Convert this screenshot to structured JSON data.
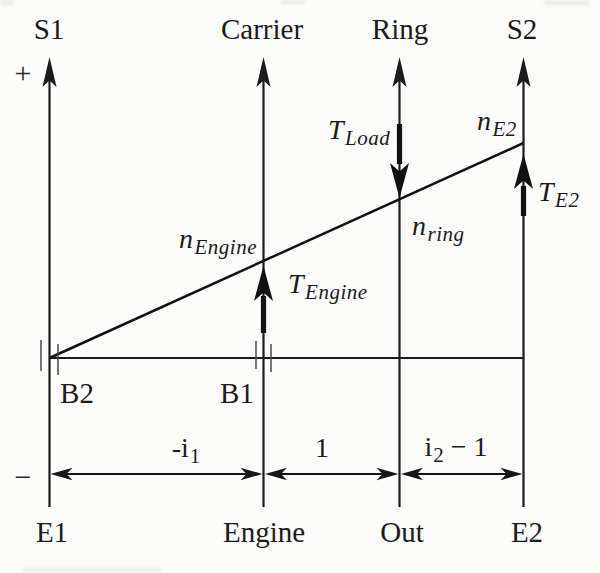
{
  "colors": {
    "ink": "#1b1b1b",
    "paper": "#fcfcfa",
    "tick": "#4a4a4a"
  },
  "signs": {
    "positive": "+",
    "negative": "−"
  },
  "axes": [
    {
      "id": "s1",
      "top_label": "S1",
      "bottom_label": "E1"
    },
    {
      "id": "carrier",
      "top_label": "Carrier",
      "bottom_label": "Engine"
    },
    {
      "id": "ring",
      "top_label": "Ring",
      "bottom_label": "Out"
    },
    {
      "id": "s2",
      "top_label": "S2",
      "bottom_label": "E2"
    }
  ],
  "support_points": {
    "b2": "B2",
    "b1": "B1"
  },
  "dimension_labels": {
    "i1": {
      "pre": "-i",
      "sub": "1",
      "post": ""
    },
    "unity": "1",
    "i2": {
      "pre": "i",
      "sub": "2",
      "post": " − 1"
    }
  },
  "speed_labels": {
    "n_engine": {
      "main": "n",
      "sub": "Engine"
    },
    "n_ring": {
      "main": "n",
      "sub": "ring"
    },
    "n_e2": {
      "main": "n",
      "sub": "E2"
    }
  },
  "torque_labels": {
    "t_engine": {
      "main": "T",
      "sub": "Engine"
    },
    "t_load": {
      "main": "T",
      "sub": "Load"
    },
    "t_e2": {
      "main": "T",
      "sub": "E2"
    }
  }
}
